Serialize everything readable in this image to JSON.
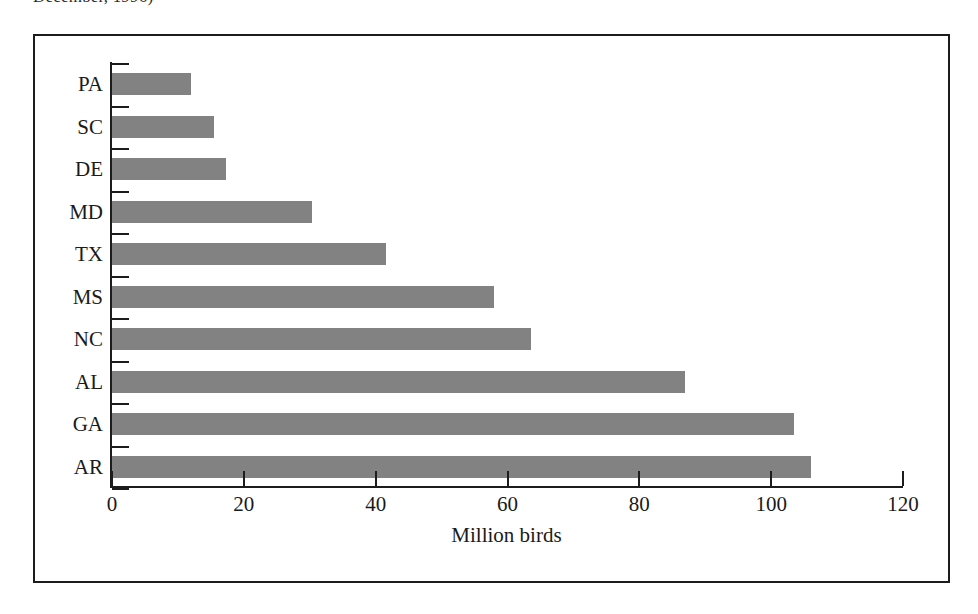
{
  "caption_fragment": "December, 1996)",
  "chart_data": {
    "type": "bar",
    "orientation": "horizontal",
    "title": "",
    "xlabel": "Million birds",
    "ylabel": "",
    "categories": [
      "PA",
      "SC",
      "DE",
      "MD",
      "TX",
      "MS",
      "NC",
      "AL",
      "GA",
      "AR"
    ],
    "values": [
      12,
      15.5,
      17.3,
      30.3,
      41.5,
      58,
      63.5,
      87,
      103.5,
      106
    ],
    "xlim": [
      0,
      120
    ],
    "xticks": [
      0,
      20,
      40,
      60,
      80,
      100,
      120
    ],
    "xtick_labels": [
      "0",
      "20",
      "40",
      "60",
      "80",
      "100",
      "120"
    ],
    "grid": false,
    "legend": false,
    "bar_color": "#828282",
    "axis_color": "#1c1c1c",
    "frame_border_color": "#1c1c1c",
    "background_color": "#ffffff"
  }
}
